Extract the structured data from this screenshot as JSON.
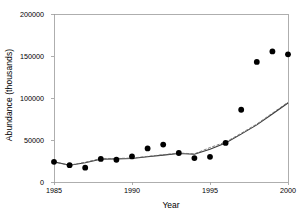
{
  "chart_data": {
    "type": "scatter",
    "title": "",
    "xlabel": "Year",
    "ylabel": "Abundance (thousands)",
    "xlim": [
      1985,
      2000
    ],
    "ylim": [
      0,
      200000
    ],
    "xticks": [
      1985,
      1990,
      1995,
      2000
    ],
    "xtick_labels": [
      "1985",
      "1990",
      "1995",
      "2000"
    ],
    "yticks": [
      0,
      50000,
      100000,
      150000,
      200000
    ],
    "ytick_labels": [
      "0",
      "50000",
      "100000",
      "150000",
      "200000"
    ],
    "grid": false,
    "legend": "none",
    "frame": "left-top-right-bottom",
    "series": [
      {
        "name": "Observed abundance",
        "type": "scatter",
        "marker": "filled-circle",
        "color": "#000000",
        "x": [
          1985,
          1986,
          1987,
          1988,
          1989,
          1990,
          1991,
          1992,
          1993,
          1994,
          1995,
          1996,
          1997,
          1998,
          1999,
          2000
        ],
        "values": [
          24000,
          20000,
          17000,
          27500,
          26500,
          30500,
          40000,
          44500,
          34500,
          28500,
          30000,
          46500,
          86000,
          143000,
          155500,
          152000
        ]
      },
      {
        "name": "Model fit (solid)",
        "type": "line",
        "style": "solid",
        "color": "#3a3a3a",
        "x": [
          1985,
          1986,
          1987,
          1988,
          1989,
          1990,
          1991,
          1992,
          1993,
          1994,
          1995,
          1996,
          1997,
          1998,
          1999,
          2000
        ],
        "values": [
          24000,
          20000,
          23000,
          27000,
          27500,
          28000,
          30000,
          32000,
          34000,
          33000,
          39000,
          46500,
          57000,
          68000,
          81000,
          94000
        ]
      },
      {
        "name": "Model fit (dashed)",
        "type": "line",
        "style": "dashed",
        "color": "#6e6e6e",
        "x": [
          1985,
          1986,
          1987,
          1988,
          1989,
          1990,
          1991,
          1992,
          1993,
          1994,
          1995,
          1996,
          1997,
          1998,
          1999,
          2000
        ],
        "values": [
          24000,
          20000,
          23500,
          28000,
          28000,
          28500,
          30500,
          32500,
          34500,
          33500,
          41000,
          47500,
          58000,
          69000,
          82000,
          95000
        ]
      }
    ]
  },
  "axes": {
    "x_tick_labels": [
      "1985",
      "1990",
      "1995",
      "2000"
    ],
    "y_tick_labels": [
      "0",
      "50000",
      "100000",
      "150000",
      "200000"
    ],
    "x_title": "Year",
    "y_title": "Abundance (thousands)"
  }
}
